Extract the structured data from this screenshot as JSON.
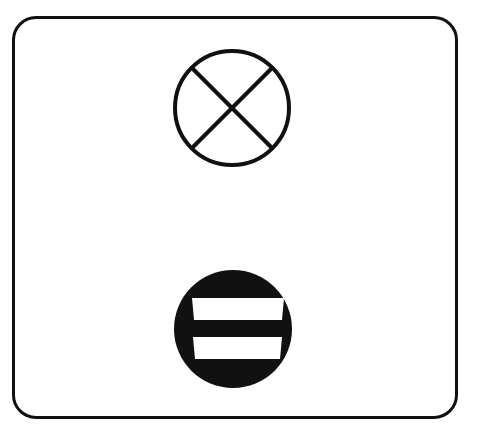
{
  "diagram": {
    "type": "symbol-panel",
    "colors": {
      "stroke": "#111111",
      "background": "#ffffff"
    },
    "symbols": [
      {
        "id": "upper",
        "icon": "circle-x-icon",
        "style": "outlined circle with diagonal cross"
      },
      {
        "id": "lower",
        "icon": "circle-double-bar-icon",
        "style": "filled black circle with two white horizontal bars"
      }
    ]
  }
}
